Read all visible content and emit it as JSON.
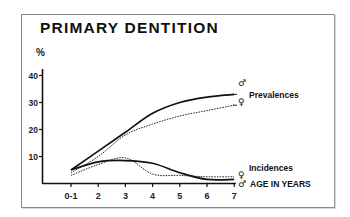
{
  "chart_data": {
    "type": "line",
    "title": "PRIMARY DENTITION",
    "xlabel": "AGE IN YEARS",
    "ylabel": "%",
    "categories": [
      "0-1",
      "2",
      "3",
      "4",
      "5",
      "6",
      "7"
    ],
    "yticks": [
      10,
      20,
      30,
      40
    ],
    "ylim": [
      0,
      40
    ],
    "grid": false,
    "series": [
      {
        "name": "Prevalences ♂",
        "group": "Prevalences",
        "sex": "male",
        "style": "solid",
        "values": [
          5,
          12,
          19,
          26,
          30,
          32,
          33
        ]
      },
      {
        "name": "Prevalences ♀",
        "group": "Prevalences",
        "sex": "female",
        "style": "dashed",
        "values": [
          4,
          10,
          18,
          22,
          25,
          27,
          29
        ]
      },
      {
        "name": "Incidences ♂",
        "group": "Incidences",
        "sex": "male",
        "style": "solid",
        "values": [
          5,
          8,
          8.5,
          7.5,
          4,
          1.5,
          1.5
        ]
      },
      {
        "name": "Incidences ♀",
        "group": "Incidences",
        "sex": "female",
        "style": "dashed",
        "values": [
          3,
          7,
          9.5,
          3.5,
          3,
          2.5,
          2.5
        ]
      }
    ],
    "annotations": [
      "Prevalences",
      "Incidences"
    ],
    "legend": "inline labels at right end of curves"
  },
  "labels": {
    "title": "PRIMARY DENTITION",
    "unit": "%",
    "xlabel": "AGE IN YEARS",
    "prevalences": "Prevalences",
    "incidences": "Incidences",
    "male_symbol": "♂",
    "female_symbol": "♀"
  },
  "colors": {
    "line": "#111111",
    "frame": "#8a8a8a",
    "background": "#ffffff"
  }
}
